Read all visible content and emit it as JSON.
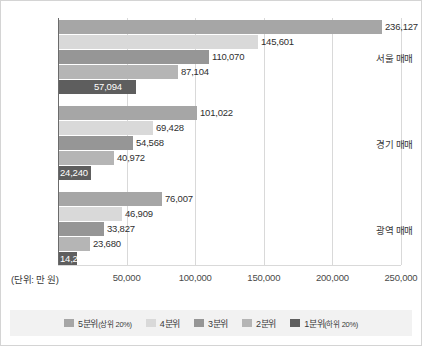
{
  "chart_data": {
    "type": "bar",
    "orientation": "horizontal",
    "title": "",
    "xlabel": "(단위: 만 원)",
    "ylabel": "",
    "xlim": [
      0,
      250000
    ],
    "grid": true,
    "legend_position": "bottom",
    "categories": [
      "서울 매매",
      "경기 매매",
      "광역 매매"
    ],
    "tick_labels": [
      "50,000",
      "100,000",
      "150,000",
      "200,000",
      "250,000"
    ],
    "tick_values": [
      50000,
      100000,
      150000,
      200000,
      250000
    ],
    "series": [
      {
        "name": "5분위(상위 20%)",
        "short": "5분위",
        "sub": "(상위 20%)",
        "color": "#a6a6a6",
        "values": [
          236127,
          101022,
          76007
        ],
        "labels": [
          "236,127",
          "101,022",
          "76,007"
        ]
      },
      {
        "name": "4분위",
        "short": "4분위",
        "sub": "",
        "color": "#d9d9d9",
        "values": [
          145601,
          69428,
          46909
        ],
        "labels": [
          "145,601",
          "69,428",
          "46,909"
        ]
      },
      {
        "name": "3분위",
        "short": "3분위",
        "sub": "",
        "color": "#969696",
        "values": [
          110070,
          54568,
          33827
        ],
        "labels": [
          "110,070",
          "54,568",
          "33,827"
        ]
      },
      {
        "name": "2분위",
        "short": "2분위",
        "sub": "",
        "color": "#b5b5b5",
        "values": [
          87104,
          40972,
          23680
        ],
        "labels": [
          "87,104",
          "40,972",
          "23,680"
        ]
      },
      {
        "name": "1분위(하위 20%)",
        "short": "1분위",
        "sub": "(하위 20%)",
        "color": "#5e5e5e",
        "values": [
          57094,
          24240,
          14200
        ],
        "labels": [
          "57,094",
          "24,240",
          "14,200"
        ]
      }
    ]
  }
}
